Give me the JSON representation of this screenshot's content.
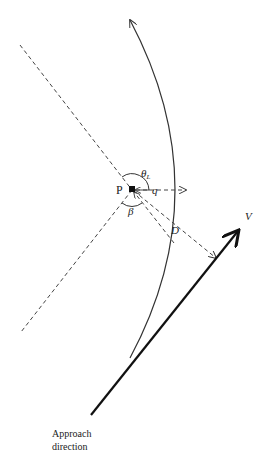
{
  "diagram": {
    "labels": {
      "point": "P",
      "theta": "θ",
      "theta_sub": "L",
      "q": "q",
      "beta": "β",
      "distance": "D",
      "velocity": "V",
      "approach_line1": "Approach",
      "approach_line2": "direction"
    },
    "colors": {
      "line": "#1a1a1a",
      "dashed": "#444444",
      "arc": "#333333"
    }
  }
}
